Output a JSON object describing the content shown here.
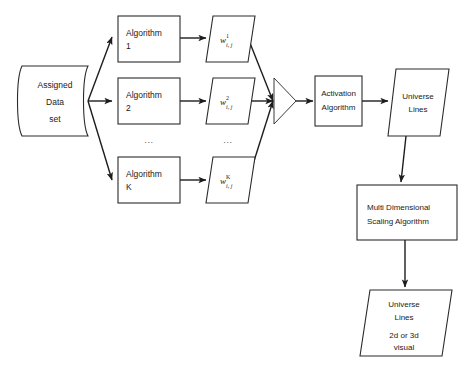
{
  "diagram": {
    "type": "flowchart",
    "title": "",
    "background_color": "#ffffff",
    "stroke_color": "#1d1d1d",
    "text_color": "#1a1a1a",
    "watermark": "",
    "nodes": {
      "data_store": {
        "shape": "document",
        "line1": "Assigned",
        "line2": "Data",
        "line3": "set"
      },
      "algorithm_1": {
        "shape": "rectangle",
        "line1": "Algorithm",
        "line2": "1"
      },
      "algorithm_2": {
        "shape": "rectangle",
        "line1": "Algorithm",
        "line2": "2"
      },
      "algorithm_k": {
        "shape": "rectangle",
        "line1": "Algorithm",
        "line2": "K"
      },
      "algorithm_ellipsis": {
        "label": "..."
      },
      "weight_1": {
        "shape": "parallelogram",
        "base": "w",
        "superscript": "1",
        "subscript": "i, j"
      },
      "weight_2": {
        "shape": "parallelogram",
        "base": "w",
        "superscript": "2",
        "subscript": "i, j"
      },
      "weight_k": {
        "shape": "parallelogram",
        "base": "w",
        "superscript": "K",
        "subscript": "i, j"
      },
      "weight_ellipsis": {
        "label": "..."
      },
      "merge_node": {
        "shape": "triangle",
        "label": ""
      },
      "activation_algorithm": {
        "shape": "rectangle",
        "line1": "Activation",
        "line2": "Algorithm"
      },
      "universe_lines_top": {
        "shape": "parallelogram",
        "line1": "Universe",
        "line2": "Lines"
      },
      "mds_algorithm": {
        "shape": "rectangle",
        "line1": "Multi Dimensional",
        "line2": "Scaling Algorithm"
      },
      "universe_lines_bottom": {
        "shape": "parallelogram",
        "line1": "Universe",
        "line2": "Lines",
        "line3": "2d or 3d",
        "line4": "visual"
      }
    }
  }
}
